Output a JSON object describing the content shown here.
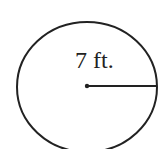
{
  "diagram": {
    "shape": "circle",
    "radius_label": "7 ft.",
    "stroke_color": "#222222",
    "background": "#ffffff"
  }
}
